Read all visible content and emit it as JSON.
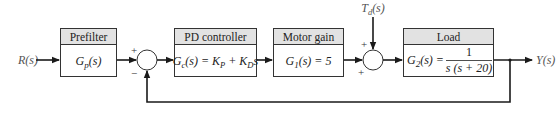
{
  "diagram": {
    "type": "closed-loop block diagram",
    "input": {
      "label": "R(s)"
    },
    "output": {
      "label": "Y(s)"
    },
    "disturbance": {
      "label": "T",
      "subscript": "d",
      "suffix": "(s)"
    },
    "blocks": [
      {
        "id": "prefilter",
        "title": "Prefilter",
        "tf_main": "G",
        "tf_sub": "p",
        "tf_rest": "(s)"
      },
      {
        "id": "pd-controller",
        "title": "PD controller",
        "tf_main": "G",
        "tf_sub": "c",
        "tf_rest": "(s) = K",
        "tf_kp_sub": "P",
        "tf_mid": " + K",
        "tf_kd_sub": "D",
        "tf_end": "s"
      },
      {
        "id": "motor-gain",
        "title": "Motor gain",
        "tf_main": "G",
        "tf_sub": "1",
        "tf_rest": "(s) = 5"
      },
      {
        "id": "load",
        "title": "Load",
        "tf_main": "G",
        "tf_sub": "2",
        "tf_rest": "(s) =",
        "numerator": "1",
        "denominator": "s (s + 20)"
      }
    ],
    "junctions": [
      {
        "id": "error-sum",
        "signs": {
          "top": "+",
          "bottom": "−"
        }
      },
      {
        "id": "disturbance-sum",
        "signs": {
          "top": "+",
          "bottom": "+"
        }
      }
    ]
  }
}
